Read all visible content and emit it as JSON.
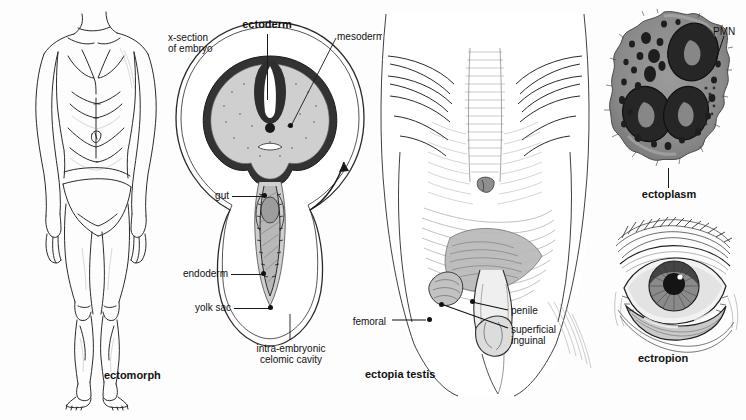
{
  "plate": {
    "title": "ecto- anatomical illustration plate",
    "background": "#fdfdfd",
    "ink": "#111111",
    "width": 746,
    "height": 420
  },
  "panels": [
    {
      "id": "ectomorph",
      "name": "ectomorph-figure",
      "caption": "ectomorph",
      "description": "full-length anterior view line drawing of a lean male body wearing briefs"
    },
    {
      "id": "embryo",
      "name": "embryo-cross-section-diagram",
      "caption": "x-section\nof embryo",
      "description": "labeled cross-section diagram of an embryo with germ layers"
    },
    {
      "id": "ectopia-testis",
      "name": "ectopia-testis-figure",
      "caption": "ectopia testis",
      "description": "lower abdomen and groin showing sites of ectopic testis"
    },
    {
      "id": "pmn",
      "name": "pmn-micrograph",
      "caption": "ectoplasm",
      "description": "electron micrograph of a polymorphonuclear leukocyte"
    },
    {
      "id": "ectropion",
      "name": "ectropion-figure",
      "caption": "ectropion",
      "description": "drawing of an eye with everted lower eyelid"
    }
  ],
  "labels": {
    "ectomorph": "ectomorph",
    "x_section_line1": "x-section",
    "x_section_line2": "of embryo",
    "ectoderm": "ectoderm",
    "mesoderm": "mesoderm",
    "gut": "gut",
    "endoderm": "endoderm",
    "yolk_sac": "yolk sac",
    "celomic_line1": "intra-embryonic",
    "celomic_line2": "celomic cavity",
    "femoral": "femoral",
    "penile": "penile",
    "superficial_line1": "superficial",
    "superficial_line2": "inguinal",
    "ectopia_testis": "ectopia testis",
    "pmn": "PMN",
    "ectoplasm": "ectoplasm",
    "ectropion": "ectropion"
  }
}
